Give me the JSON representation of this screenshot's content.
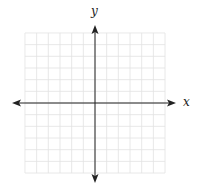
{
  "diagram": {
    "type": "coordinate-plane",
    "x_axis_label": "x",
    "y_axis_label": "y",
    "grid": {
      "columns": 12,
      "rows": 12,
      "cells_left_of_y_axis": 6,
      "cells_right_of_y_axis": 6,
      "cells_above_x_axis": 6,
      "cells_below_x_axis": 6,
      "line_color": "#e2e2e2"
    },
    "axis_color": "#222222",
    "arrows": [
      "left",
      "right",
      "up",
      "down"
    ]
  }
}
